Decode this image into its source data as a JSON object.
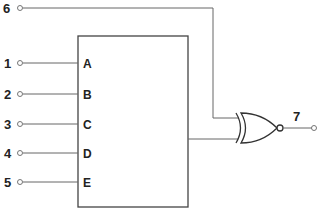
{
  "diagram": {
    "type": "logic-circuit",
    "block": {
      "pins": [
        {
          "name": "A",
          "terminal": "1",
          "y": 63
        },
        {
          "name": "B",
          "terminal": "2",
          "y": 94
        },
        {
          "name": "C",
          "terminal": "3",
          "y": 124
        },
        {
          "name": "D",
          "terminal": "4",
          "y": 153
        },
        {
          "name": "E",
          "terminal": "5",
          "y": 182
        }
      ]
    },
    "extra_input": {
      "terminal": "6",
      "y": 8
    },
    "gate": {
      "kind": "XNOR"
    },
    "output": {
      "terminal": "7"
    }
  }
}
